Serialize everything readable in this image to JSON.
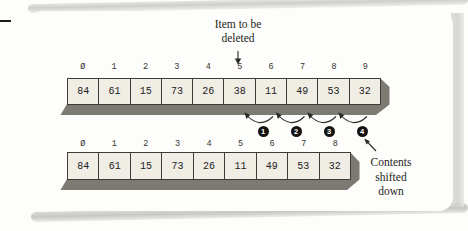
{
  "annotations": {
    "deleted_pointer": {
      "line1": "Item to be",
      "line2": "deleted"
    },
    "shifted_note": {
      "line1": "Contents",
      "line2": "shifted",
      "line3": "down"
    }
  },
  "arrays": {
    "top": {
      "indices": [
        "Ø",
        "1",
        "2",
        "3",
        "4",
        "5",
        "6",
        "7",
        "8",
        "9"
      ],
      "values": [
        "84",
        "61",
        "15",
        "73",
        "26",
        "38",
        "11",
        "49",
        "53",
        "32"
      ]
    },
    "bottom": {
      "indices": [
        "Ø",
        "1",
        "2",
        "3",
        "4",
        "5",
        "6",
        "7",
        "8"
      ],
      "values": [
        "84",
        "61",
        "15",
        "73",
        "26",
        "11",
        "49",
        "53",
        "32"
      ]
    }
  },
  "shift_steps": [
    "1",
    "2",
    "3",
    "4"
  ],
  "colors": {
    "cell_fill": "#f0ede5",
    "cell_border": "#3d3c39",
    "extrusion_shadow": "#7d7a74",
    "ink": "#2b2a27",
    "step_badge_bg": "#151310",
    "step_badge_text": "#ffffff"
  }
}
